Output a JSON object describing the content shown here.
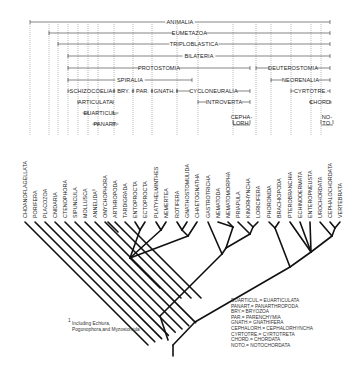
{
  "colors": {
    "line": "#111111",
    "text": "#222222",
    "dotted": "#555555",
    "background": "#ffffff"
  },
  "clades": [
    {
      "label": "ANIMALIA",
      "x1": 30,
      "x2": 330,
      "y": 22
    },
    {
      "label": "EUMETAZOA",
      "x1": 49,
      "x2": 330,
      "y": 33
    },
    {
      "label": "TRIPLOBLASTICA",
      "x1": 58,
      "x2": 330,
      "y": 44
    },
    {
      "label": "BILATERIA",
      "x1": 68,
      "x2": 330,
      "y": 56
    },
    {
      "label": "PROTOSTOMIA",
      "x1": 68,
      "x2": 250,
      "y": 68
    },
    {
      "label": "DEUTEROSTOMIA",
      "x1": 256,
      "x2": 330,
      "y": 68
    },
    {
      "label": "SPIRALIA",
      "x1": 68,
      "x2": 192,
      "y": 80
    },
    {
      "label": "NEORENALIA",
      "x1": 271,
      "x2": 330,
      "y": 80
    },
    {
      "label": "SCHIZOCOELIA",
      "x1": 68,
      "x2": 114,
      "y": 91
    },
    {
      "label": "BRY.",
      "x1": 114,
      "x2": 133,
      "y": 91
    },
    {
      "label": "PAR.",
      "x1": 133,
      "x2": 152,
      "y": 91
    },
    {
      "label": "GNATH.",
      "x1": 152,
      "x2": 177,
      "y": 91
    },
    {
      "label": "CYCLONEURALIA",
      "x1": 177,
      "x2": 250,
      "y": 91
    },
    {
      "label": "CYRTOTRE.",
      "x1": 291,
      "x2": 330,
      "y": 91
    },
    {
      "label": "ARTICULATA",
      "x1": 78,
      "x2": 113,
      "y": 102
    },
    {
      "label": "INTROVERTA",
      "x1": 198,
      "x2": 250,
      "y": 102
    },
    {
      "label": "CHORD.",
      "x1": 311,
      "x2": 330,
      "y": 102
    },
    {
      "label": "EUARTICUL.",
      "x1": 88,
      "x2": 113,
      "y": 113
    },
    {
      "label": "PANART.",
      "x1": 98,
      "x2": 113,
      "y": 124
    },
    {
      "label": "CEPHA-\nLORH.",
      "x1": 233,
      "x2": 250,
      "y": 122
    },
    {
      "label": "NO-\nTO.",
      "x1": 321,
      "x2": 333,
      "y": 122
    }
  ],
  "leaves": [
    {
      "name": "Choanoflagellata",
      "x": 25
    },
    {
      "name": "Porifera",
      "x": 35
    },
    {
      "name": "Placozoa",
      "x": 45
    },
    {
      "name": "Cnidaria",
      "x": 55
    },
    {
      "name": "Ctenophora",
      "x": 65
    },
    {
      "name": "Sipuncula",
      "x": 75
    },
    {
      "name": "Mollusca",
      "x": 85
    },
    {
      "name": "Annelida¹",
      "x": 95
    },
    {
      "name": "Onychophora",
      "x": 105
    },
    {
      "name": "Arthropoda",
      "x": 115
    },
    {
      "name": "Tardigrada",
      "x": 125
    },
    {
      "name": "Entoprocta",
      "x": 135
    },
    {
      "name": "Ectoprocta",
      "x": 145
    },
    {
      "name": "Platyhelminthes",
      "x": 156
    },
    {
      "name": "Nemertea",
      "x": 166
    },
    {
      "name": "Rotifera",
      "x": 177
    },
    {
      "name": "Gnathostomulida",
      "x": 187
    },
    {
      "name": "Chaetognatha",
      "x": 197
    },
    {
      "name": "Gastrotricha",
      "x": 208
    },
    {
      "name": "Nematoda",
      "x": 218
    },
    {
      "name": "Nematomorpha",
      "x": 228
    },
    {
      "name": "Priapula",
      "x": 238
    },
    {
      "name": "Kinorhyncha",
      "x": 248
    },
    {
      "name": "Loricifera",
      "x": 258
    },
    {
      "name": "Phoronida",
      "x": 269
    },
    {
      "name": "Brachiopoda",
      "x": 279
    },
    {
      "name": "Pterobranchia",
      "x": 290
    },
    {
      "name": "Echinodermata",
      "x": 300
    },
    {
      "name": "Enteropneusta",
      "x": 310
    },
    {
      "name": "Urochordata",
      "x": 320
    },
    {
      "name": "Cephalochordata",
      "x": 330
    },
    {
      "name": "Vertebrata",
      "x": 340
    }
  ],
  "footnote": {
    "marker": "1",
    "line1": "Including Echiura,",
    "line2": "Pogonophora,and Myzostomida"
  },
  "legend": [
    "EUARTICUL.= EUARTICULATA",
    "PANART.= PANARTHROPODA",
    "BRY.= BRYOZOA",
    "PAR.= PARENCHYMIA",
    "GNATH.= GNATHIFERA",
    "CEPHALORH.= CEPHALORHYNCHA",
    "CYRTOTRE.= CYRTOTRETA",
    "CHORD.= CHORDATA",
    "NOTO.= NOTOCHORDATA"
  ]
}
